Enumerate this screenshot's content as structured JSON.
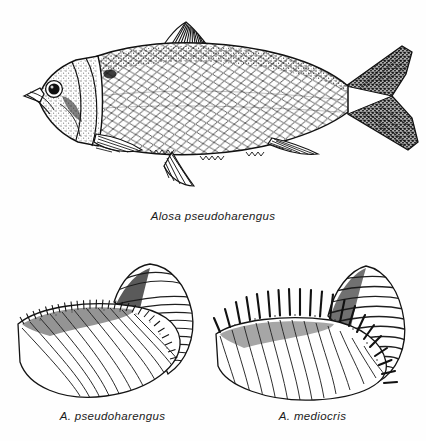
{
  "plate": {
    "background_color": "#fefefe",
    "ink_color": "#111111",
    "width": 426,
    "height": 441
  },
  "figures": [
    {
      "id": "fish",
      "subject": "alewife-lateral-view",
      "caption": "Alosa pseudoharengus",
      "features": [
        "dorsal-fin",
        "caudal-fin",
        "anal-fin",
        "pelvic-fin",
        "pectoral-fin",
        "eye",
        "operculum",
        "scales",
        "shoulder-spot"
      ]
    },
    {
      "id": "gill-arch-left",
      "subject": "gill-arch-alewife",
      "caption": "A. pseudoharengus",
      "raker_count": 44,
      "raker_style": "numerous-fine-short"
    },
    {
      "id": "gill-arch-right",
      "subject": "gill-arch-hickory-shad",
      "caption": "A. mediocris",
      "raker_count": 21,
      "raker_style": "few-long-stout"
    }
  ]
}
